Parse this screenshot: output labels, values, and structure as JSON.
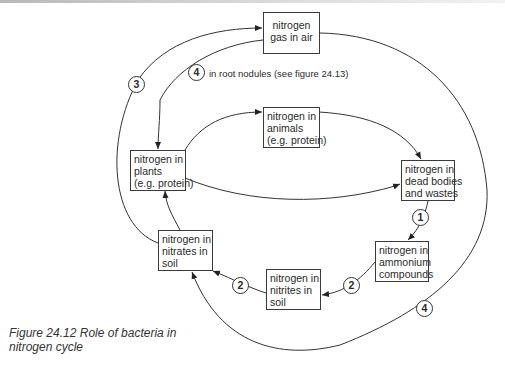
{
  "diagram": {
    "nodes": {
      "gas_in_air": {
        "lines": [
          "nitrogen",
          "gas in air"
        ]
      },
      "animals": {
        "lines": [
          "nitrogen in",
          "animals",
          "(e.g. protein)"
        ]
      },
      "plants": {
        "lines": [
          "nitrogen in",
          "plants",
          "(e.g. protein)"
        ]
      },
      "dead_bodies": {
        "lines": [
          "nitrogen in",
          "dead bodies",
          "and wastes"
        ]
      },
      "ammonium": {
        "lines": [
          "nitrogen in",
          "ammonium",
          "compounds"
        ]
      },
      "nitrites": {
        "lines": [
          "nitrogen in",
          "nitrites in",
          "soil"
        ]
      },
      "nitrates": {
        "lines": [
          "nitrogen in",
          "nitrates in",
          "soil"
        ]
      }
    },
    "badges": {
      "denitrification": "3",
      "root_nodules": "4",
      "putrefaction": "1",
      "nitrite_to_nitrate": "2",
      "ammonium_to_nitrite": "2",
      "soil_fixation": "4"
    },
    "annotations": {
      "root_nodules": "in root nodules (see figure 24.13)"
    },
    "edges": [
      {
        "from": "nitrates",
        "to": "gas_in_air",
        "label": "3"
      },
      {
        "from": "gas_in_air",
        "to": "plants",
        "label": "4",
        "note": "in root nodules (see figure 24.13)"
      },
      {
        "from": "plants",
        "to": "animals"
      },
      {
        "from": "animals",
        "to": "dead_bodies"
      },
      {
        "from": "plants",
        "to": "dead_bodies"
      },
      {
        "from": "dead_bodies",
        "to": "ammonium",
        "label": "1"
      },
      {
        "from": "ammonium",
        "to": "nitrites",
        "label": "2"
      },
      {
        "from": "nitrites",
        "to": "nitrates",
        "label": "2"
      },
      {
        "from": "nitrates",
        "to": "plants"
      },
      {
        "from": "gas_in_air",
        "to": "nitrates",
        "label": "4"
      }
    ]
  },
  "caption": {
    "line1": "Figure 24.12  Role of bacteria in",
    "line2": "nitrogen cycle"
  }
}
